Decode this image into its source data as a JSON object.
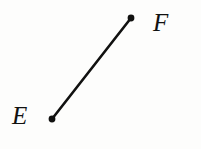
{
  "figure": {
    "kind": "geometry-line-segment",
    "background_color": "#fdfdfc",
    "ink_color": "#111110",
    "width": 201,
    "height": 149
  },
  "segment": {
    "name": "segment-EF",
    "stroke_color": "#111110",
    "stroke_width": 2.6,
    "x1": 52,
    "y1": 119,
    "x2": 131,
    "y2": 18
  },
  "points": [
    {
      "id": "E",
      "label": "E",
      "dot_color": "#111110",
      "dot_radius": 3.4,
      "cx": 52,
      "cy": 119,
      "label_position": "left"
    },
    {
      "id": "F",
      "label": "F",
      "dot_color": "#111110",
      "dot_radius": 3.4,
      "cx": 131,
      "cy": 18,
      "label_position": "right"
    }
  ]
}
